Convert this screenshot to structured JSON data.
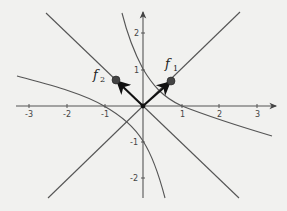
{
  "diagram": {
    "type": "coordinate-plane",
    "x_axis": {
      "ticks": [
        "-3",
        "-2",
        "-1",
        "1",
        "2",
        "3"
      ]
    },
    "y_axis": {
      "ticks": [
        "2",
        "1",
        "-1",
        "-2"
      ]
    },
    "vectors": [
      {
        "name": "f",
        "subscript": "1",
        "direction": "up-right"
      },
      {
        "name": "f",
        "subscript": "2",
        "direction": "up-left"
      }
    ],
    "lines": [
      "y = x",
      "y = -x"
    ],
    "curves": [
      "upper-right hyperbola branch",
      "lower-left hyperbola branch"
    ],
    "colors": {
      "background": "#f1f1ef",
      "curves": "#555555",
      "vectors": "#111111"
    }
  }
}
